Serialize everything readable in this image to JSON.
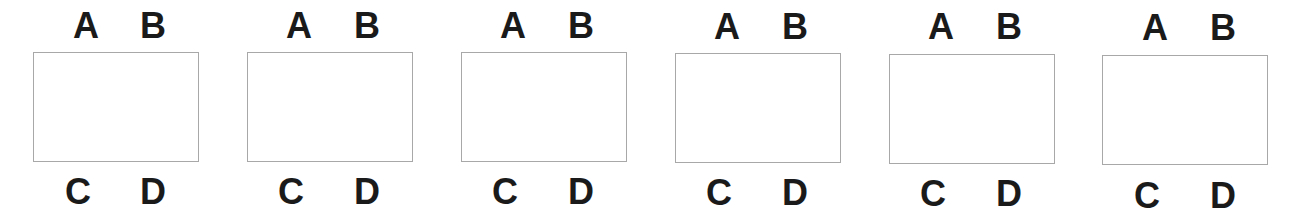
{
  "panels": [
    {
      "labels": {
        "top_left": "A",
        "top_right": "B",
        "bottom_left": "C",
        "bottom_right": "D"
      }
    },
    {
      "labels": {
        "top_left": "A",
        "top_right": "B",
        "bottom_left": "C",
        "bottom_right": "D"
      }
    },
    {
      "labels": {
        "top_left": "A",
        "top_right": "B",
        "bottom_left": "C",
        "bottom_right": "D"
      }
    },
    {
      "labels": {
        "top_left": "A",
        "top_right": "B",
        "bottom_left": "C",
        "bottom_right": "D"
      }
    },
    {
      "labels": {
        "top_left": "A",
        "top_right": "B",
        "bottom_left": "C",
        "bottom_right": "D"
      }
    },
    {
      "labels": {
        "top_left": "A",
        "top_right": "B",
        "bottom_left": "C",
        "bottom_right": "D"
      }
    }
  ],
  "colors": {
    "label": "#1a1a1a",
    "border": "#a8a8a8"
  }
}
